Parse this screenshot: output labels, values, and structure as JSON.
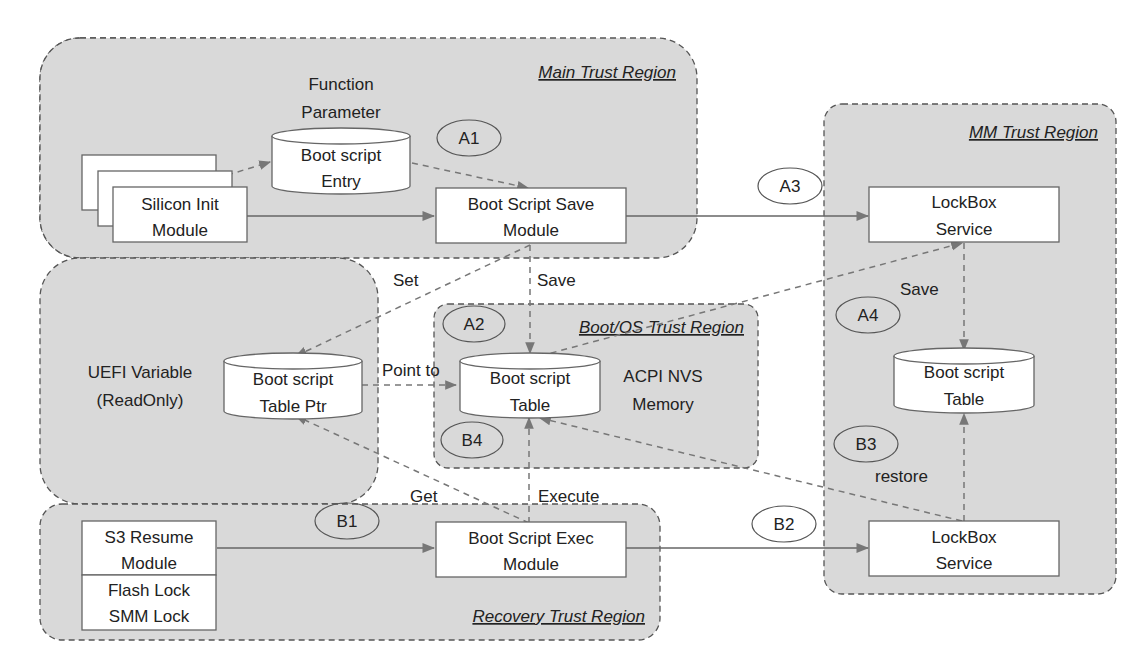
{
  "regions": {
    "main": "Main Trust Region",
    "mm": "MM Trust Region",
    "boot_os": "Boot/OS Trust Region",
    "recovery": "Recovery Trust Region",
    "uefi_variable": [
      "UEFI Variable",
      "(ReadOnly)"
    ]
  },
  "nodes": {
    "silicon_init": [
      "Silicon Init",
      "Module"
    ],
    "function_parameter": [
      "Function",
      "Parameter"
    ],
    "boot_script_entry": [
      "Boot script",
      "Entry"
    ],
    "boot_script_save": [
      "Boot Script Save",
      "Module"
    ],
    "lockbox_top": [
      "LockBox",
      "Service"
    ],
    "bs_table_ptr": [
      "Boot script",
      "Table Ptr"
    ],
    "bs_table_os": [
      "Boot script",
      "Table"
    ],
    "acpi_nvs": [
      "ACPI NVS",
      "Memory"
    ],
    "bs_table_mm": [
      "Boot script",
      "Table"
    ],
    "s3_resume": [
      "S3 Resume",
      "Module"
    ],
    "flash_lock": [
      "Flash Lock",
      "SMM Lock"
    ],
    "boot_script_exec": [
      "Boot Script Exec",
      "Module"
    ],
    "lockbox_bottom": [
      "LockBox",
      "Service"
    ]
  },
  "steps": {
    "a1": "A1",
    "a2": "A2",
    "a3": "A3",
    "a4": "A4",
    "b1": "B1",
    "b2": "B2",
    "b3": "B3",
    "b4": "B4"
  },
  "edges": {
    "set": "Set",
    "save_os": "Save",
    "point_to": "Point to",
    "save_mm": "Save",
    "get": "Get",
    "execute": "Execute",
    "restore": "restore"
  }
}
